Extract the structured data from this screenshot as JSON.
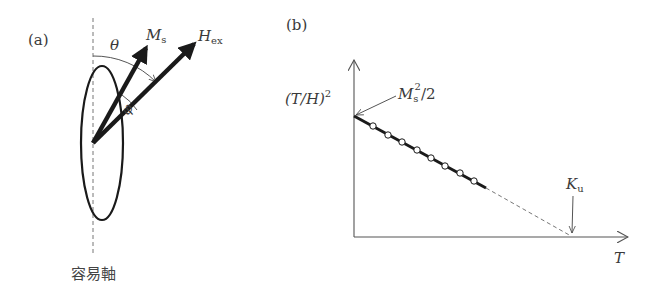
{
  "panel_a": {
    "label": "(a)",
    "axis_label": "容易軸",
    "vectors": [
      {
        "name": "M",
        "sub": "s"
      },
      {
        "name": "H",
        "sub": "ex"
      }
    ],
    "angles": [
      {
        "symbol": "θ",
        "between": [
          "容易軸",
          "H_ex"
        ]
      },
      {
        "symbol": "φ",
        "between": [
          "M_s",
          "H_ex"
        ]
      }
    ]
  },
  "panel_b": {
    "label": "(b)",
    "y_axis_label": "(T/H)",
    "y_axis_sup": "2",
    "x_axis_label": "T",
    "intercept_y": {
      "base": "M",
      "sub": "s",
      "sup": "2",
      "rest": "/2"
    },
    "intercept_x": {
      "base": "K",
      "sub": "u"
    },
    "data_point_count": 8
  },
  "colors": {
    "line": "#1a1a1a",
    "axis": "#555555",
    "dashed": "#777777"
  }
}
